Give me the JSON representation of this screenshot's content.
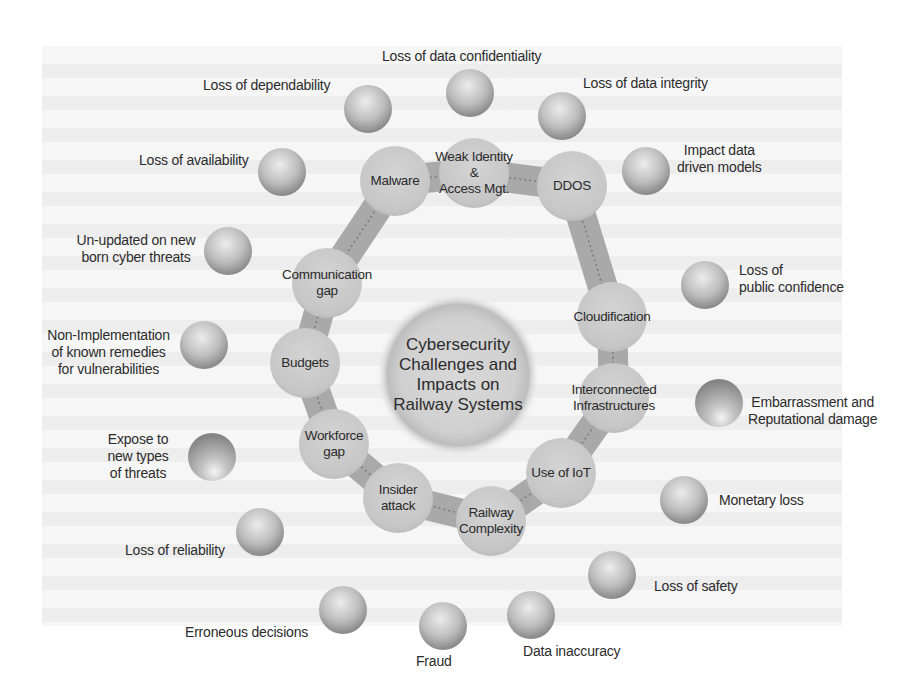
{
  "diagram": {
    "center": {
      "title_lines": [
        "Cybersecurity",
        "Challenges and",
        "Impacts on",
        "Railway Systems"
      ]
    },
    "challenges": [
      {
        "id": "malware",
        "lines": [
          "Malware"
        ]
      },
      {
        "id": "weak-identity",
        "lines": [
          "Weak Identity",
          "&",
          "Access Mgt."
        ]
      },
      {
        "id": "ddos",
        "lines": [
          "DDOS"
        ]
      },
      {
        "id": "cloudification",
        "lines": [
          "Cloudification"
        ]
      },
      {
        "id": "interconnected",
        "lines": [
          "Interconnected",
          "Infrastructures"
        ]
      },
      {
        "id": "iot",
        "lines": [
          "Use of IoT"
        ]
      },
      {
        "id": "railway-complexity",
        "lines": [
          "Railway",
          "Complexity"
        ]
      },
      {
        "id": "insider-attack",
        "lines": [
          "Insider",
          "attack"
        ]
      },
      {
        "id": "workforce-gap",
        "lines": [
          "Workforce",
          "gap"
        ]
      },
      {
        "id": "budgets",
        "lines": [
          "Budgets"
        ]
      },
      {
        "id": "communication-gap",
        "lines": [
          "Communication",
          "gap"
        ]
      }
    ],
    "impacts": [
      {
        "id": "loss-dependability",
        "lines": [
          "Loss of dependability"
        ]
      },
      {
        "id": "loss-confidentiality",
        "lines": [
          "Loss of data confidentiality"
        ]
      },
      {
        "id": "loss-integrity",
        "lines": [
          "Loss of data integrity"
        ]
      },
      {
        "id": "impact-models",
        "lines": [
          "Impact data",
          "driven models"
        ]
      },
      {
        "id": "loss-public-confidence",
        "lines": [
          "Loss of",
          "public confidence"
        ]
      },
      {
        "id": "embarrassment",
        "lines": [
          "Embarrassment and",
          "Reputational damage"
        ]
      },
      {
        "id": "monetary-loss",
        "lines": [
          "Monetary loss"
        ]
      },
      {
        "id": "loss-safety",
        "lines": [
          "Loss of safety"
        ]
      },
      {
        "id": "data-inaccuracy",
        "lines": [
          "Data inaccuracy"
        ]
      },
      {
        "id": "fraud",
        "lines": [
          "Fraud"
        ]
      },
      {
        "id": "erroneous-decisions",
        "lines": [
          "Erroneous decisions"
        ]
      },
      {
        "id": "loss-reliability",
        "lines": [
          "Loss of reliability"
        ]
      },
      {
        "id": "expose-threats",
        "lines": [
          "Expose to",
          "new types",
          "of threats"
        ]
      },
      {
        "id": "non-implementation",
        "lines": [
          "Non-Implementation",
          "of known remedies",
          "for vulnerabilities"
        ]
      },
      {
        "id": "un-updated",
        "lines": [
          "Un-updated on new",
          "born cyber threats"
        ]
      },
      {
        "id": "loss-availability",
        "lines": [
          "Loss of availability"
        ]
      }
    ],
    "colors": {
      "node_fill": "#c9c9c9",
      "ring_band": "#a8a8a8",
      "sphere_dark": "#8a8a8a",
      "sphere_light": "#e8e8e8",
      "text": "#2b2b2b"
    }
  }
}
